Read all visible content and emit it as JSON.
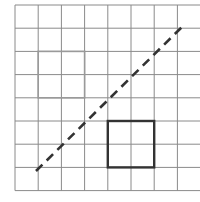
{
  "figure": {
    "label": ")",
    "grid": {
      "x_start": 15,
      "y_start": 5,
      "cell": 23.2,
      "cols": 8,
      "rows": 8,
      "line_color": "#8a8a8a"
    },
    "shapes": [
      {
        "name": "original-square",
        "col": 1,
        "row": 2,
        "size": 2,
        "stroke": "#9a9a9a",
        "width": 1.6
      },
      {
        "name": "reflected-square",
        "col": 4,
        "row": 5,
        "size": 2,
        "stroke": "#333333",
        "width": 2.4
      }
    ],
    "mirror_line": {
      "x1": 36,
      "y1": 171,
      "x2": 185,
      "y2": 24,
      "stroke": "#333333",
      "dash": "9,6"
    }
  }
}
